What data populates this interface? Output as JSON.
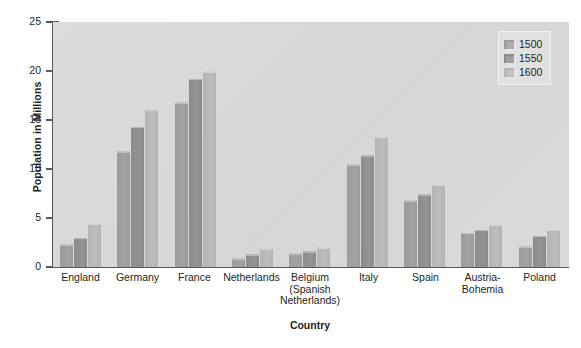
{
  "chart_data": {
    "type": "bar",
    "title": "",
    "xlabel": "Country",
    "ylabel": "Population in Millions",
    "ylim": [
      0,
      25
    ],
    "yticks": [
      0,
      5,
      10,
      15,
      20,
      25
    ],
    "grid": false,
    "legend_position": "top-right",
    "categories": [
      "England",
      "Germany",
      "France",
      "Netherlands",
      "Belgium (Spanish Netherlands)",
      "Italy",
      "Spain",
      "Austria-Bohemia",
      "Poland"
    ],
    "category_lines": [
      [
        "England"
      ],
      [
        "Germany"
      ],
      [
        "France"
      ],
      [
        "Netherlands"
      ],
      [
        "Belgium",
        "(Spanish",
        "Netherlands)"
      ],
      [
        "Italy"
      ],
      [
        "Spain"
      ],
      [
        "Austria-",
        "Bohemia"
      ],
      [
        "Poland"
      ]
    ],
    "series": [
      {
        "name": "1500",
        "color": "#9b9b9b",
        "values": [
          2.3,
          11.8,
          16.8,
          0.9,
          1.4,
          10.5,
          6.8,
          3.5,
          2.1
        ]
      },
      {
        "name": "1550",
        "color": "#8b8b8b",
        "values": [
          3.0,
          14.3,
          19.2,
          1.3,
          1.6,
          11.4,
          7.4,
          3.8,
          3.2
        ]
      },
      {
        "name": "1600",
        "color": "#b4b4b4",
        "values": [
          4.4,
          16.1,
          20.0,
          1.9,
          2.0,
          13.3,
          8.4,
          4.3,
          3.8
        ]
      }
    ]
  },
  "legend": {
    "items": [
      {
        "label": "1500"
      },
      {
        "label": "1550"
      },
      {
        "label": "1600"
      }
    ]
  },
  "caption": {
    "text": ""
  },
  "colors": {
    "plot_background": "#d9d9d9",
    "axis": "#58595b",
    "text": "#231f20",
    "series_1500": "#9b9b9b",
    "series_1550": "#8b8b8b",
    "series_1600": "#b4b4b4"
  }
}
